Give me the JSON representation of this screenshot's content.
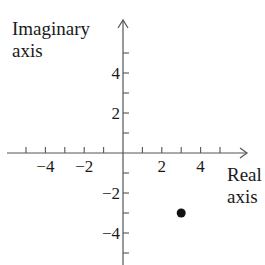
{
  "chart_data": {
    "type": "scatter",
    "title": "",
    "xlabel": "Real axis",
    "ylabel": "Imaginary axis",
    "xlabel_lines": [
      "Real",
      "axis"
    ],
    "ylabel_lines": [
      "Imaginary",
      "axis"
    ],
    "xlim": [
      -6,
      6
    ],
    "ylim": [
      -6,
      6
    ],
    "x_ticks": [
      -5,
      -4,
      -3,
      -2,
      -1,
      1,
      2,
      3,
      4,
      5
    ],
    "y_ticks": [
      -5,
      -4,
      -3,
      -2,
      -1,
      1,
      2,
      3,
      4,
      5
    ],
    "x_tick_labels": [
      {
        "value": -4,
        "label": "−4"
      },
      {
        "value": -2,
        "label": "−2"
      },
      {
        "value": 2,
        "label": "2"
      },
      {
        "value": 4,
        "label": "4"
      }
    ],
    "y_tick_labels": [
      {
        "value": 4,
        "label": "4"
      },
      {
        "value": 2,
        "label": "2"
      },
      {
        "value": -2,
        "label": "−2"
      },
      {
        "value": -4,
        "label": "−4"
      }
    ],
    "grid": false,
    "legend": null,
    "points": [
      {
        "x": 3,
        "y": -3,
        "label": "3 − 3i"
      }
    ],
    "colors": {
      "axis": "#555555",
      "point": "#111111",
      "text": "#1a1a1a"
    }
  }
}
